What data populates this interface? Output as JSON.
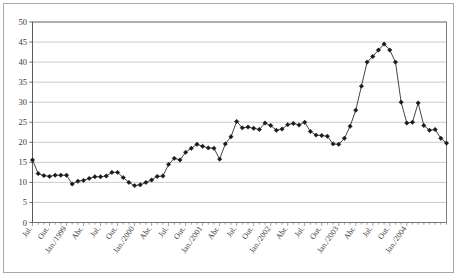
{
  "chart_data": {
    "type": "line",
    "title": "",
    "subtitle": "",
    "xlabel": "",
    "ylabel": "",
    "ylim": [
      0,
      50
    ],
    "ytick_labels": [
      "0",
      "5",
      "10",
      "15",
      "20",
      "25",
      "30",
      "35",
      "40",
      "45",
      "50"
    ],
    "ytick_values": [
      0,
      5,
      10,
      15,
      20,
      25,
      30,
      35,
      40,
      45,
      50
    ],
    "grid": true,
    "legend": "none",
    "marker": "diamond",
    "line_color": "#222222",
    "marker_color": "#1a1a1a",
    "grid_color": "#b4b4b4",
    "axis_color": "#6e6e6e",
    "plot_background": "#ffffff",
    "xtick_labels": [
      "Jul.",
      "Out.",
      "Jan./1999",
      "Abr.",
      "Jul.",
      "Out.",
      "Jan./2000",
      "Abr.",
      "Jul.",
      "Out.",
      "Jan./2001",
      "Abr.",
      "Jul.",
      "Out.",
      "Jan./2002",
      "Abr.",
      "Jul.",
      "Out.",
      "Jan./2003",
      "Abr.",
      "Jul.",
      "Out.",
      "Jan./2004"
    ],
    "xtick_label_indices": [
      0,
      3,
      6,
      9,
      12,
      15,
      18,
      21,
      24,
      27,
      30,
      33,
      36,
      39,
      42,
      45,
      48,
      51,
      54,
      57,
      60,
      63,
      66
    ],
    "x": [
      "Jul./1998",
      "Ago./1998",
      "Set./1998",
      "Out./1998",
      "Nov./1998",
      "Dez./1998",
      "Jan./1999",
      "Fev./1999",
      "Mar./1999",
      "Abr./1999",
      "Mai./1999",
      "Jun./1999",
      "Jul./1999",
      "Ago./1999",
      "Set./1999",
      "Out./1999",
      "Nov./1999",
      "Dez./1999",
      "Jan./2000",
      "Fev./2000",
      "Mar./2000",
      "Abr./2000",
      "Mai./2000",
      "Jun./2000",
      "Jul./2000",
      "Ago./2000",
      "Set./2000",
      "Out./2000",
      "Nov./2000",
      "Dez./2000",
      "Jan./2001",
      "Fev./2001",
      "Mar./2001",
      "Abr./2001",
      "Mai./2001",
      "Jun./2001",
      "Jul./2001",
      "Ago./2001",
      "Set./2001",
      "Out./2001",
      "Nov./2001",
      "Dez./2001",
      "Jan./2002",
      "Fev./2002",
      "Mar./2002",
      "Abr./2002",
      "Mai./2002",
      "Jun./2002",
      "Jul./2002",
      "Ago./2002",
      "Set./2002",
      "Out./2002",
      "Nov./2002",
      "Dez./2002",
      "Jan./2003",
      "Fev./2003",
      "Mar./2003",
      "Abr./2003",
      "Mai./2003",
      "Jun./2003",
      "Jul./2003",
      "Ago./2003",
      "Set./2003",
      "Out./2003",
      "Nov./2003",
      "Dez./2003",
      "Jan./2004",
      "Fev./2004"
    ],
    "values": [
      15.6,
      12.2,
      11.7,
      11.5,
      11.8,
      11.8,
      11.8,
      9.6,
      10.3,
      10.5,
      11.0,
      11.4,
      11.4,
      11.6,
      12.5,
      12.5,
      11.2,
      10.0,
      9.2,
      9.4,
      10.0,
      10.6,
      11.5,
      11.6,
      14.5,
      16.0,
      15.6,
      17.5,
      18.5,
      19.5,
      19.0,
      18.6,
      18.5,
      15.8,
      19.6,
      21.4,
      25.2,
      23.6,
      23.8,
      23.5,
      23.2,
      24.8,
      24.2,
      23.0,
      23.3,
      24.4,
      24.7,
      24.3,
      25.0,
      22.7,
      21.8,
      21.7,
      21.5,
      19.6,
      19.5,
      21.0,
      24.0,
      28.0,
      34.0,
      40.0,
      41.4,
      43.0,
      44.5,
      43.0,
      40.0,
      30.0,
      24.8,
      25.0
    ],
    "values_tail": [
      29.8,
      24.2,
      23.0,
      23.2,
      21.0,
      19.8
    ]
  }
}
